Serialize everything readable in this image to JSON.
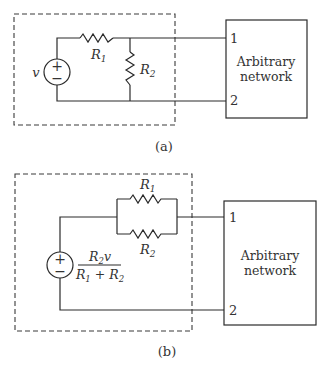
{
  "figure_a": {
    "source_label": "v",
    "source_plus": "+",
    "source_minus": "−",
    "r1_label": "R",
    "r1_sub": "1",
    "r2_label": "R",
    "r2_sub": "2",
    "terminal_1": "1",
    "terminal_2": "2",
    "network_line1": "Arbitrary",
    "network_line2": "network",
    "caption": "(a)"
  },
  "figure_b": {
    "source_plus": "+",
    "source_minus": "−",
    "source_num_r": "R",
    "source_num_sub": "2",
    "source_num_v": "v",
    "source_den_r1": "R",
    "source_den_sub1": "1",
    "source_den_plus": " + ",
    "source_den_r2": "R",
    "source_den_sub2": "2",
    "r1_label": "R",
    "r1_sub": "1",
    "r2_label": "R",
    "r2_sub": "2",
    "terminal_1": "1",
    "terminal_2": "2",
    "network_line1": "Arbitrary",
    "network_line2": "network",
    "caption": "(b)"
  }
}
